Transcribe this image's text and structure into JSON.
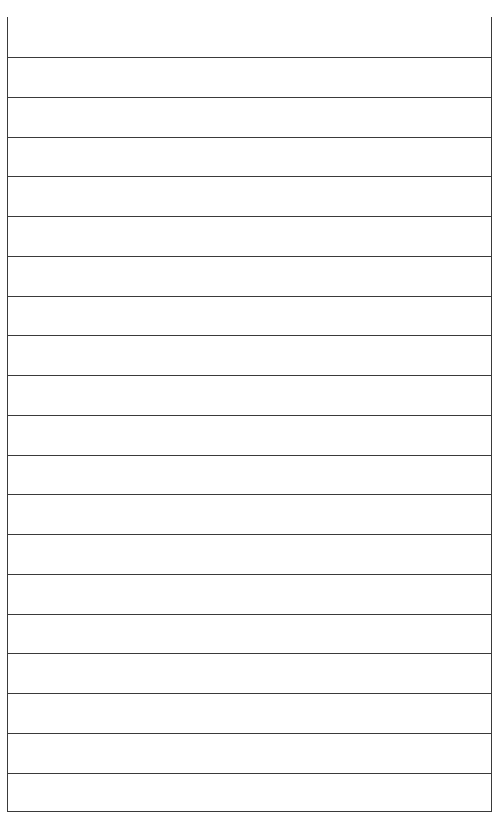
{
  "page": {
    "type": "ruled-table",
    "header": {
      "text": ""
    },
    "row_count": 19,
    "rows": [
      "",
      "",
      "",
      "",
      "",
      "",
      "",
      "",
      "",
      "",
      "",
      "",
      "",
      "",
      "",
      "",
      "",
      "",
      ""
    ],
    "line_color": "#3a3a3a",
    "background": "#ffffff"
  }
}
